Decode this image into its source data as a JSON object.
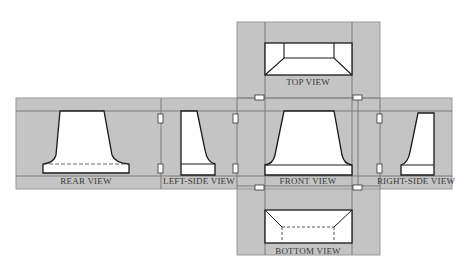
{
  "diagram": {
    "type": "orthographic-projection-glass-box",
    "colors": {
      "panel_fill": "#c4c4c4",
      "panel_border": "#9a9a9a",
      "fold_line": "#7a7a7a",
      "object_fill": "#ffffff",
      "object_stroke": "#1a1a1a",
      "label_text": "#3a3a3a",
      "background": "#ffffff"
    },
    "views": [
      {
        "id": "top",
        "label": "TOP VIEW"
      },
      {
        "id": "rear",
        "label": "REAR VIEW"
      },
      {
        "id": "left-side",
        "label": "LEFT-SIDE VIEW"
      },
      {
        "id": "front",
        "label": "FRONT VIEW"
      },
      {
        "id": "right-side",
        "label": "RIGHT-SIDE VIEW"
      },
      {
        "id": "bottom",
        "label": "BOTTOM VIEW"
      }
    ],
    "hinge_count": 8
  }
}
